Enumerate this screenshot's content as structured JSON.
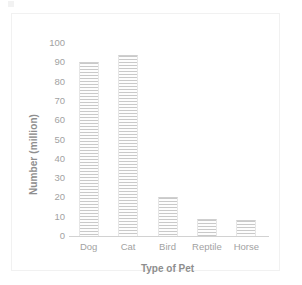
{
  "chart_data": {
    "type": "bar",
    "title": "",
    "subtitle": "",
    "categories": [
      "Dog",
      "Cat",
      "Bird",
      "Reptile",
      "Horse"
    ],
    "values": [
      90,
      94,
      20,
      9,
      8.5
    ],
    "series": [
      {
        "name": "Number of pets",
        "values": [
          90,
          94,
          20,
          9,
          8.5
        ]
      }
    ],
    "xlabel": "Type of Pet",
    "ylabel": "Number (million)",
    "ylim": [
      0,
      100
    ],
    "yticks": [
      0,
      10,
      20,
      30,
      40,
      50,
      60,
      70,
      80,
      90,
      100
    ],
    "ytick_labels": [
      "0",
      "10",
      "20",
      "30",
      "40",
      "50",
      "60",
      "70",
      "80",
      "90",
      "100"
    ],
    "grid": false,
    "legend": false,
    "legend_position": "none",
    "bar_fill": "#fbfbfb",
    "bar_hatch": "horizontal-lines",
    "bar_hatch_color": "#c9c9c9",
    "axis_color": "#d2d2d2",
    "text_color": "#9a9a9a"
  },
  "figure": {
    "frame_border_color": "#f1f1f1",
    "background_color": "#ffffff",
    "artifact_label": "scan-artifact"
  }
}
